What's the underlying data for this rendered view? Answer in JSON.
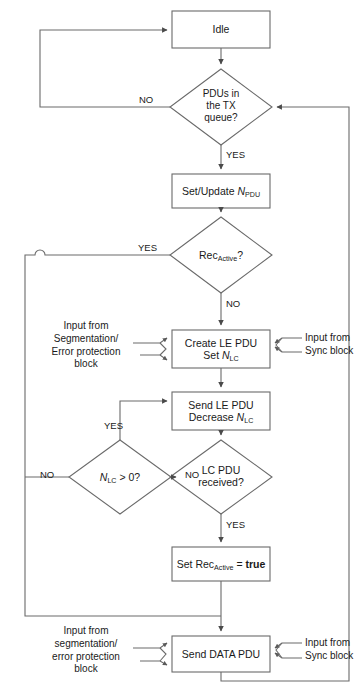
{
  "diagram": {
    "stroke_color": "#5a5a5a",
    "text_color": "#1a1a1a",
    "nodes": {
      "idle": {
        "label": "Idle",
        "shape": "process"
      },
      "pdus_in_tx_queue": {
        "line1": "PDUs in",
        "line2": "the TX",
        "line3": "queue?",
        "shape": "decision"
      },
      "set_update_npdu": {
        "prefix": "Set/Update ",
        "var": "N",
        "sub": "PDU",
        "shape": "process"
      },
      "rec_active_check": {
        "prefix": "Rec",
        "sub": "Active",
        "suffix": "?",
        "shape": "decision"
      },
      "create_le_pdu": {
        "line1": "Create LE PDU",
        "line2_prefix": "Set ",
        "var": "N",
        "sub": "LC",
        "shape": "process"
      },
      "send_le_pdu": {
        "line1": "Send LE PDU",
        "line2_prefix": "Decrease ",
        "var": "N",
        "sub": "LC",
        "shape": "process"
      },
      "nlc_gt_zero": {
        "var": "N",
        "sub": "LC",
        "suffix": " > 0?",
        "shape": "decision"
      },
      "lc_pdu_received": {
        "line1": "LC PDU",
        "line2": "received?",
        "shape": "decision"
      },
      "set_rec_active_true": {
        "prefix": "Set Rec",
        "sub": "Active",
        "eq": " = ",
        "value": "true",
        "shape": "process"
      },
      "send_data_pdu": {
        "label": "Send DATA PDU",
        "shape": "process"
      }
    },
    "edge_labels": {
      "pdus_no": "NO",
      "pdus_yes": "YES",
      "rec_active_yes": "YES",
      "rec_active_no": "NO",
      "nlc_yes": "YES",
      "nlc_no": "NO",
      "lc_no": "NO",
      "lc_yes": "YES"
    },
    "annotations": {
      "input_seg_upper": {
        "line1": "Input from",
        "line2": "Segmentation/",
        "line3": "Error protection",
        "line4": "block"
      },
      "input_sync_upper": {
        "line1": "Input from",
        "line2": "Sync block"
      },
      "input_seg_lower": {
        "line1": "Input from",
        "line2": "segmentation/",
        "line3": "error protection",
        "line4": "block"
      },
      "input_sync_lower": {
        "line1": "Input from",
        "line2": "Sync block"
      }
    }
  }
}
